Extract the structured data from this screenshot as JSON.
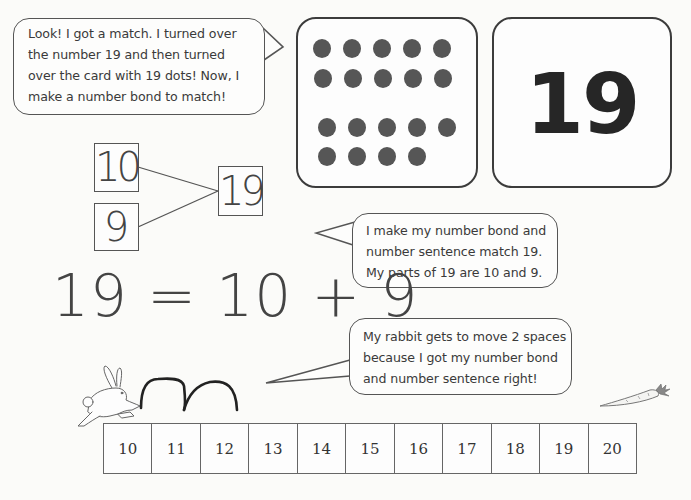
{
  "bubbles": {
    "intro": {
      "lines": [
        "Look!  I got a match.  I turned over",
        "the number 19 and then turned",
        "over the card with 19 dots!  Now, I",
        "make a number bond to match!"
      ]
    },
    "bond_explanation": {
      "lines": [
        "I make my number bond and",
        "number sentence match 19.",
        "My parts of 19 are 10 and 9."
      ]
    },
    "rabbit_move": {
      "lines": [
        "My rabbit gets to move 2 spaces",
        "because I got my number bond",
        "and number sentence right!"
      ]
    }
  },
  "cards": {
    "dot_card": {
      "dot_count": 19,
      "rows": [
        5,
        5,
        5,
        4
      ]
    },
    "number_card": {
      "value": "19"
    }
  },
  "number_bond": {
    "part1": "10",
    "part2": "9",
    "whole": "19"
  },
  "number_sentence": {
    "text": "19 = 10 + 9"
  },
  "game": {
    "rabbit_icon": "rabbit-icon",
    "carrot_icon": "carrot-icon",
    "hops": 2
  },
  "number_line": {
    "cells": [
      "10",
      "11",
      "12",
      "13",
      "14",
      "15",
      "16",
      "17",
      "18",
      "19",
      "20"
    ]
  },
  "colors": {
    "dot": "#565656",
    "outline": "#3c3c3c",
    "text": "#3a3a3a",
    "background": "#fbfbf9"
  }
}
